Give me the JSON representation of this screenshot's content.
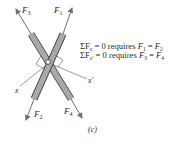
{
  "diagram": {
    "caption": "(c)",
    "colors": {
      "bar_fill": "#a9a9a9",
      "bar_stroke": "#3a3a3a",
      "arrow": "#6f6f6f",
      "axis_line": "#555555",
      "text": "#2a2a2a"
    },
    "forces": {
      "F1": {
        "symbol": "F",
        "sub": "1"
      },
      "F2": {
        "symbol": "F",
        "sub": "2"
      },
      "F3": {
        "symbol": "F",
        "sub": "3"
      },
      "F4": {
        "symbol": "F",
        "sub": "4"
      }
    },
    "axes": {
      "x": "x",
      "x_prime": "x′"
    },
    "equations": [
      {
        "sum": "ΣF",
        "sub": "x",
        "rest": " = 0 requires ",
        "lhs_sub": "1",
        "rhs_sub": "2",
        "full": "ΣFx = 0 requires F1 = F2"
      },
      {
        "sum": "ΣF",
        "sub": "x′",
        "rest": " = 0 requires ",
        "lhs_sub": "3",
        "rhs_sub": "4",
        "full": "ΣFx′ = 0 requires F3 = F4"
      }
    ]
  }
}
